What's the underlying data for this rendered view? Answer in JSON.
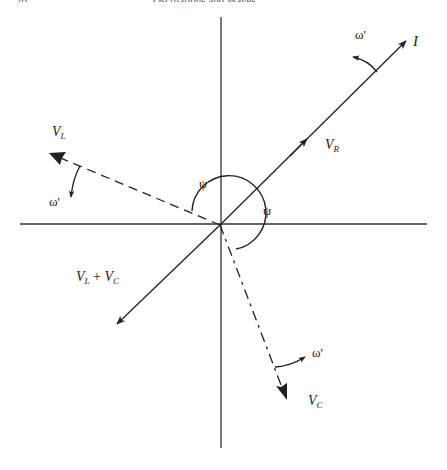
{
  "page_header": {
    "page_number": "20",
    "running_title": "Oscillations and Waves"
  },
  "diagram": {
    "type": "phasor-diagram",
    "origin": [
      220,
      225
    ],
    "axes": {
      "horizontal": {
        "x1": 20,
        "x2": 427,
        "y": 224
      },
      "vertical": {
        "x": 221,
        "y1": 17,
        "y2": 448
      }
    },
    "labels": {
      "I": {
        "main": "I",
        "sub": ""
      },
      "V_R": {
        "main": "V",
        "sub": "R"
      },
      "V_L": {
        "main": "V",
        "sub": "L"
      },
      "V_C": {
        "main": "V",
        "sub": "C"
      },
      "V_L_plus_V_C": {
        "main1": "V",
        "sub1": "L",
        "op": " + ",
        "main2": "V",
        "sub2": "C"
      },
      "psi_upper": "ψ",
      "psi_right": "ψ",
      "omega_I": "ω'",
      "omega_L": "ω'",
      "omega_C": "ω'"
    },
    "vectors": [
      {
        "name": "I",
        "style": "solid",
        "from": [
          220,
          225
        ],
        "to": [
          406,
          41
        ]
      },
      {
        "name": "V_R",
        "style": "solid",
        "from": [
          220,
          225
        ],
        "to": [
          306,
          140
        ],
        "note": "arrowhead midway along I line"
      },
      {
        "name": "V_L + V_C",
        "style": "solid",
        "from": [
          220,
          225
        ],
        "to": [
          117,
          324
        ]
      },
      {
        "name": "V_L",
        "style": "dashed",
        "from": [
          220,
          225
        ],
        "to": [
          49,
          153
        ]
      },
      {
        "name": "V_C",
        "style": "dash-dot",
        "from": [
          220,
          225
        ],
        "to": [
          287,
          400
        ]
      }
    ],
    "angles": [
      {
        "name": "ψ",
        "between": [
          "V_L",
          "I"
        ]
      },
      {
        "name": "ψ",
        "between": [
          "I",
          "V_C"
        ]
      }
    ],
    "rotation_indicators": [
      {
        "label": "ω'",
        "near": "I",
        "direction": "counter-clockwise"
      },
      {
        "label": "ω'",
        "near": "V_L",
        "direction": "counter-clockwise"
      },
      {
        "label": "ω'",
        "near": "V_C",
        "direction": "counter-clockwise"
      }
    ],
    "colors": {
      "ink": "#222222",
      "background": "#ffffff"
    }
  }
}
